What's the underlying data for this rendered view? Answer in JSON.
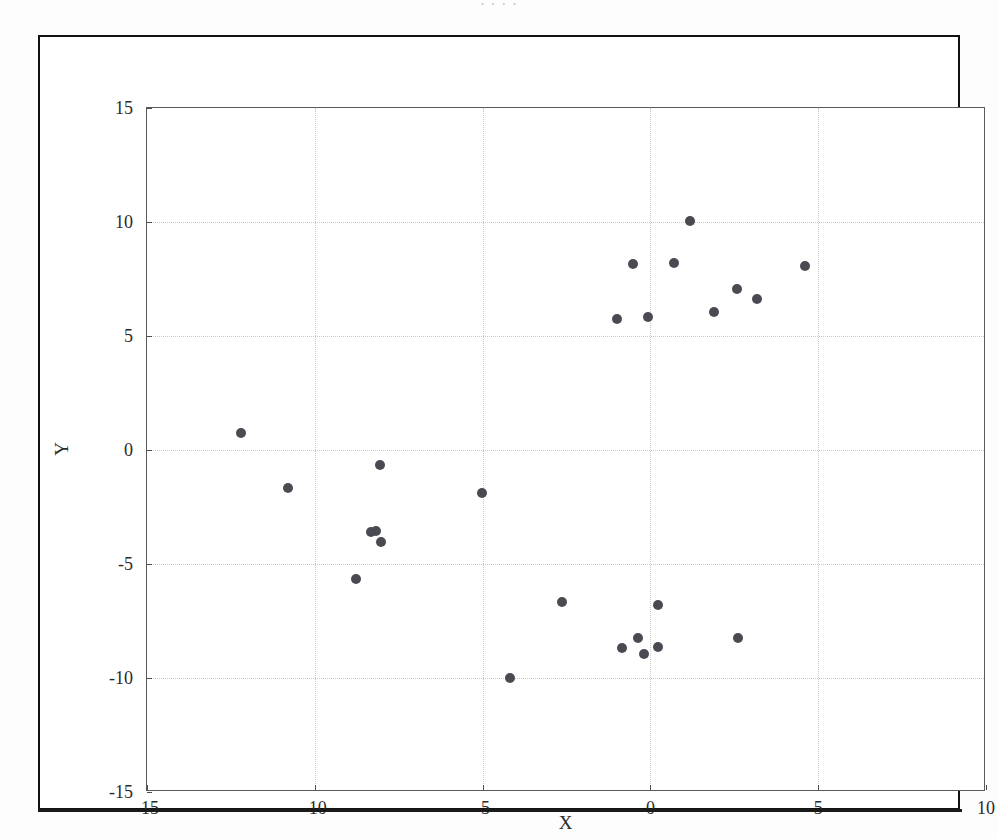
{
  "page": {
    "caption_strip": "                                        ·  ·  ·                              ·"
  },
  "figure": {
    "background_color": "#ffffff",
    "frame_color": "#111111",
    "axes_border_color": "#5a5a5a",
    "grid_color": "#c9c9c9",
    "marker_color": "#4a4a52"
  },
  "chart_data": {
    "type": "scatter",
    "title": "",
    "xlabel": "X",
    "ylabel": "Y",
    "xlim": [
      -15,
      10
    ],
    "ylim": [
      -15,
      15
    ],
    "xticks": [
      -15,
      -10,
      -5,
      0,
      5,
      10
    ],
    "yticks": [
      -15,
      -10,
      -5,
      0,
      5,
      10,
      15
    ],
    "xticklabels": [
      "-15",
      "-10",
      "-5",
      "0",
      "5",
      "10"
    ],
    "yticklabels": [
      "-15",
      "-10",
      "-5",
      "0",
      "5",
      "10",
      "15"
    ],
    "grid": true,
    "grid_style": "dotted",
    "legend": null,
    "marker": "circle",
    "marker_size": 10,
    "series": [
      {
        "name": "data",
        "color": "#4a4a52",
        "points": [
          [
            1.19,
            10.06
          ],
          [
            -0.53,
            8.16
          ],
          [
            0.69,
            8.2
          ],
          [
            4.62,
            8.06
          ],
          [
            2.59,
            7.05
          ],
          [
            3.18,
            6.62
          ],
          [
            1.89,
            6.07
          ],
          [
            -0.06,
            5.85
          ],
          [
            -1.0,
            5.75
          ],
          [
            -12.19,
            0.73
          ],
          [
            -8.07,
            -0.66
          ],
          [
            -10.8,
            -1.67
          ],
          [
            -5.01,
            -1.9
          ],
          [
            -8.17,
            -3.54
          ],
          [
            -8.32,
            -3.61
          ],
          [
            -8.02,
            -4.05
          ],
          [
            -8.78,
            -5.66
          ],
          [
            -2.64,
            -6.68
          ],
          [
            0.22,
            -6.81
          ],
          [
            -0.36,
            -8.26
          ],
          [
            2.62,
            -8.25
          ],
          [
            0.22,
            -8.65
          ],
          [
            -0.84,
            -8.7
          ],
          [
            -0.18,
            -8.93
          ],
          [
            -4.17,
            -10.01
          ]
        ]
      }
    ]
  }
}
